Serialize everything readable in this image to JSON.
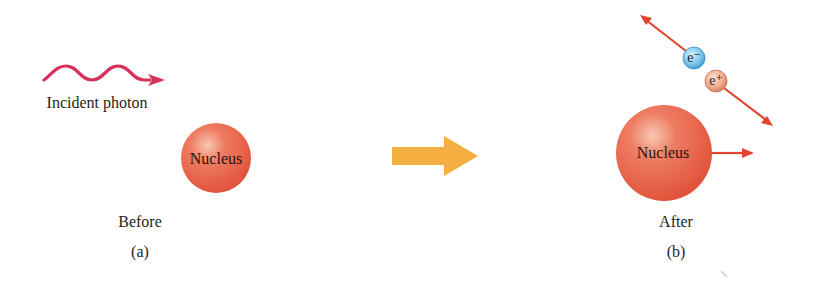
{
  "panel_a": {
    "photon_label": "Incident photon",
    "nucleus_label": "Nucleus",
    "state_label": "Before",
    "panel_letter": "(a)"
  },
  "panel_b": {
    "nucleus_label": "Nucleus",
    "electron_label": "e⁻",
    "positron_label": "e⁺",
    "state_label": "After",
    "panel_letter": "(b)"
  },
  "transition_arrow": {
    "icon": "right-arrow-icon"
  },
  "colors": {
    "photon": "#d8315b",
    "nucleus": "#e8634a",
    "nucleus_highlight": "#f6b8a2",
    "transition_arrow": "#f5b041",
    "momentum_arrow": "#e2452b",
    "electron": "#6cc0ea",
    "positron": "#f0a58a"
  }
}
